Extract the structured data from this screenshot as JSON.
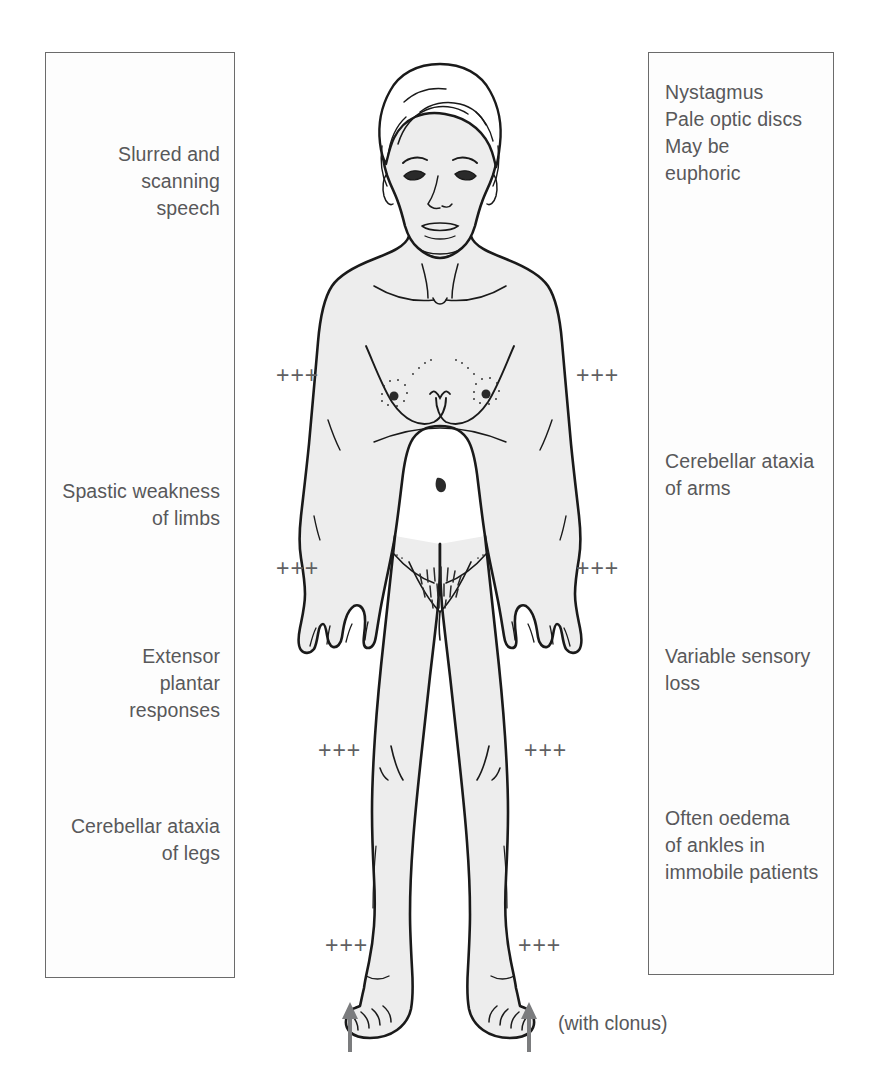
{
  "diagram": {
    "background_color": "#ffffff",
    "text_color": "#58585a",
    "panel_border_color": "#6b6b6b",
    "skin_fill_color": "#ededed",
    "outline_color": "#1a1a1a"
  },
  "left_panel": {
    "align": "right",
    "notes": [
      {
        "id": "speech",
        "text": "Slurred and\nscanning\nspeech"
      },
      {
        "id": "spastic-weakness",
        "text": "Spastic weakness\nof limbs"
      },
      {
        "id": "extensor-plantar",
        "text": "Extensor\nplantar\nresponses"
      },
      {
        "id": "ataxia-legs",
        "text": "Cerebellar ataxia\nof legs"
      }
    ]
  },
  "right_panel": {
    "align": "left",
    "notes": [
      {
        "id": "eye-and-mood",
        "text": "Nystagmus\nPale optic discs\nMay be\neuphoric"
      },
      {
        "id": "ataxia-arms",
        "text": "Cerebellar ataxia\nof arms"
      },
      {
        "id": "sensory-loss",
        "text": "Variable sensory\nloss"
      },
      {
        "id": "ankle-oedema",
        "text": "Often oedema\nof ankles in\nimmobile patients"
      }
    ]
  },
  "reflex_markers": {
    "symbol": "+++",
    "meaning": "exaggerated tendon reflex",
    "positions": [
      {
        "id": "biceps-left",
        "side": "left",
        "level": "biceps",
        "x": 276,
        "y": 364
      },
      {
        "id": "biceps-right",
        "side": "right",
        "level": "biceps",
        "x": 576,
        "y": 364
      },
      {
        "id": "supinator-left",
        "side": "left",
        "level": "supinator",
        "x": 276,
        "y": 557
      },
      {
        "id": "supinator-right",
        "side": "right",
        "level": "supinator",
        "x": 576,
        "y": 557
      },
      {
        "id": "knee-left",
        "side": "left",
        "level": "knee",
        "x": 318,
        "y": 739
      },
      {
        "id": "knee-right",
        "side": "right",
        "level": "knee",
        "x": 524,
        "y": 739
      },
      {
        "id": "ankle-left",
        "side": "left",
        "level": "ankle",
        "x": 325,
        "y": 934
      },
      {
        "id": "ankle-right",
        "side": "right",
        "level": "ankle",
        "x": 518,
        "y": 934
      }
    ]
  },
  "clonus": {
    "caption": "(with clonus)",
    "arrow_color": "#7b7c7e",
    "arrows": [
      {
        "id": "clonus-arrow-left",
        "x": 341,
        "y": 1000
      },
      {
        "id": "clonus-arrow-right",
        "x": 520,
        "y": 1000
      }
    ]
  }
}
